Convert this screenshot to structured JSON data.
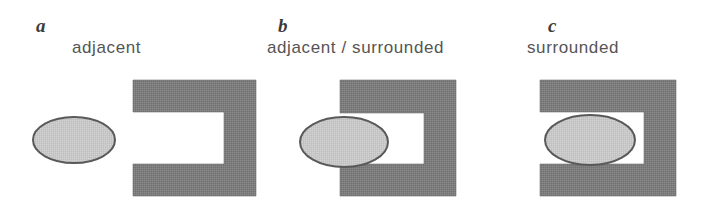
{
  "figure": {
    "caption_color": "#555555",
    "letter_color": "#3b3b3b",
    "shape_fill": "#7f7f7f",
    "shape_stroke": "#6e6e6e",
    "ellipse_fill": "#c9c9c9",
    "ellipse_stroke": "#595959",
    "background": "#ffffff"
  },
  "panels": [
    {
      "letter": "a",
      "caption": "adjacent",
      "relation": "ellipse outside the C-shape opening",
      "ellipse": {
        "cx": 74,
        "cy": 140,
        "rx": 41,
        "ry": 23
      },
      "c_shape": {
        "left": 133,
        "right": 256,
        "top": 80,
        "bottom": 196,
        "bar_thickness": 32,
        "opening": "left"
      }
    },
    {
      "letter": "b",
      "caption": "adjacent / surrounded",
      "relation": "ellipse straddling the C-shape opening",
      "ellipse": {
        "cx": 344,
        "cy": 142,
        "rx": 44,
        "ry": 25
      },
      "c_shape": {
        "left": 340,
        "right": 456,
        "top": 80,
        "bottom": 196,
        "bar_thickness": 33,
        "opening": "left"
      }
    },
    {
      "letter": "c",
      "caption": "surrounded",
      "relation": "ellipse inside the C-shape cavity",
      "ellipse": {
        "cx": 590,
        "cy": 140,
        "rx": 45,
        "ry": 25
      },
      "c_shape": {
        "left": 540,
        "right": 676,
        "top": 80,
        "bottom": 196,
        "bar_thickness": 32,
        "opening": "left"
      }
    }
  ]
}
